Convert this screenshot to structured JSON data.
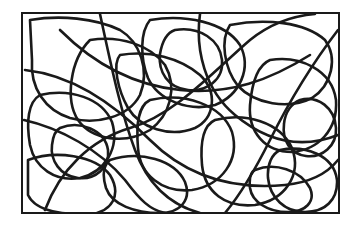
{
  "image": {
    "description": "Abstract black line drawing of tangled rounded loops enclosed in a rectangular frame",
    "background": "#ffffff",
    "stroke_color": "#1a1a1a",
    "frame": {
      "x": 22,
      "y": 13,
      "width": 317,
      "height": 200,
      "stroke_width": 2
    },
    "line_width": 2.6,
    "loops": [
      "M30,20 C60,15 95,18 120,30 C140,42 150,70 140,95 C128,118 95,125 70,118 C45,110 30,88 32,60 Z",
      "M90,40 C120,35 150,45 165,65 C178,88 170,115 150,130 C125,145 92,140 78,120 C65,100 70,60 90,40 Z",
      "M150,20 C185,14 225,22 240,45 C252,68 240,95 215,105 C188,112 158,100 148,78 C140,58 140,32 150,20 Z",
      "M230,25 C265,18 305,22 325,40 C338,58 332,85 312,98 C288,110 255,104 238,86 C224,68 220,40 230,25 Z",
      "M270,60 C300,55 332,70 336,100 C338,130 318,150 292,152 C265,152 248,132 250,105 C252,82 258,65 270,60 Z",
      "M40,95 C70,88 102,98 112,122 C120,148 105,172 80,178 C55,182 35,168 30,145 C26,122 28,102 40,95 Z",
      "M150,100 C185,92 222,105 232,132 C240,160 222,185 192,190 C162,193 140,175 138,148 C136,124 138,106 150,100 Z",
      "M215,120 C245,112 280,122 292,148 C302,175 285,200 255,205 C225,208 205,192 202,165 C200,142 204,125 215,120 Z",
      "M28,160 C55,150 95,155 110,175 C122,195 112,212 90,214 C60,215 35,210 28,195 Z",
      "M110,160 C140,150 175,160 185,182 C192,200 180,213 160,213 C135,213 112,205 106,188 C102,175 104,165 110,160 Z",
      "M280,150 C305,145 334,155 337,180 C338,200 325,212 305,212 C285,212 270,198 268,178 C267,164 272,154 280,150 Z",
      "M60,30 C90,60 130,85 180,90 C230,95 270,80 310,55",
      "M25,70 C70,75 110,100 150,140 C185,175 230,190 285,185 C315,182 330,170 338,160",
      "M45,210 C60,170 90,140 130,128 C175,115 215,70 250,40 C270,24 290,16 315,14",
      "M100,14 C110,60 120,110 135,150 C148,185 170,205 200,213",
      "M200,14 C195,50 205,90 235,115 C265,140 300,150 338,135",
      "M24,120 C60,128 100,150 125,180 C140,200 150,210 165,213",
      "M338,30 C315,60 290,100 270,140 C255,170 240,195 225,213",
      "M120,55 C150,50 180,58 200,75 C218,92 215,118 195,128 C170,138 140,128 128,108 C118,90 112,64 120,55 Z",
      "M255,170 C275,162 300,170 310,188 C316,202 305,212 288,212 C268,212 252,202 250,188 C249,178 250,172 255,170 Z",
      "M60,128 C80,120 105,130 108,150 C110,168 95,180 78,178 C60,176 50,160 52,145 C53,136 56,130 60,128 Z",
      "M175,30 C200,26 220,40 222,60 C224,80 206,92 188,90 C168,88 158,72 160,54 C162,42 166,33 175,30 Z",
      "M300,100 C318,95 335,108 336,128 C337,146 322,158 306,156 C290,154 282,140 284,124 C285,112 292,103 300,100 Z"
    ]
  }
}
